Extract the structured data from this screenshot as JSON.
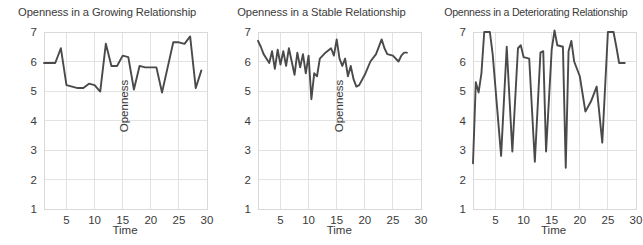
{
  "figure": {
    "width": 643,
    "height": 245,
    "background": "#ffffff",
    "line_color": "#4a4a4a",
    "grid_color": "#e2e2e2",
    "text_color": "#3a3a3a"
  },
  "chart_data": [
    {
      "type": "line",
      "title": "Openness in a Growing Relationship",
      "xlabel": "Time",
      "ylabel": "Openness",
      "xlim": [
        1,
        30
      ],
      "ylim": [
        1,
        7
      ],
      "xticks": [
        5,
        10,
        15,
        20,
        25,
        30
      ],
      "yticks": [
        1,
        2,
        3,
        4,
        5,
        6,
        7
      ],
      "grid": true,
      "legend": "none",
      "x": [
        1,
        2,
        3,
        4,
        5,
        6,
        7,
        8,
        9,
        10,
        11,
        12,
        13,
        14,
        15,
        16,
        17,
        18,
        19,
        20,
        21,
        22,
        23,
        24,
        25,
        26,
        27,
        28,
        29
      ],
      "values": [
        5.95,
        5.95,
        5.95,
        6.45,
        5.2,
        5.15,
        5.1,
        5.1,
        5.25,
        5.2,
        4.98,
        6.6,
        5.85,
        5.85,
        6.2,
        6.15,
        5.05,
        5.85,
        5.8,
        5.8,
        5.8,
        4.95,
        5.8,
        6.65,
        6.65,
        6.6,
        6.85,
        5.1,
        5.7
      ]
    },
    {
      "type": "line",
      "title": "Openness in a Stable Relationship",
      "xlabel": "Time",
      "ylabel": "Openness",
      "xlim": [
        1,
        30
      ],
      "ylim": [
        1,
        7
      ],
      "xticks": [
        5,
        10,
        15,
        20,
        25,
        30
      ],
      "yticks": [
        1,
        2,
        3,
        4,
        5,
        6,
        7
      ],
      "grid": true,
      "legend": "none",
      "x": [
        1,
        1.5,
        2,
        2.5,
        3,
        3.5,
        4,
        4.5,
        5,
        5.5,
        6,
        6.5,
        7,
        7.5,
        8,
        8.5,
        9,
        9.5,
        10,
        10.5,
        11,
        11.5,
        12,
        13,
        14,
        14.5,
        15,
        15.5,
        16,
        16.5,
        17,
        17.5,
        18,
        18.5,
        19,
        20,
        21,
        22,
        23,
        23.5,
        24,
        25,
        26,
        26.5,
        27,
        27.5
      ],
      "values": [
        6.7,
        6.5,
        6.25,
        6.1,
        5.95,
        6.35,
        5.75,
        6.4,
        5.9,
        6.35,
        5.85,
        6.45,
        6.0,
        5.55,
        6.3,
        5.8,
        6.25,
        5.6,
        6.2,
        4.72,
        5.6,
        5.5,
        6.1,
        6.3,
        6.45,
        6.2,
        6.75,
        6.1,
        5.85,
        6.1,
        5.5,
        5.85,
        5.4,
        5.15,
        5.2,
        5.55,
        6.0,
        6.25,
        6.75,
        6.45,
        6.25,
        6.2,
        6.0,
        6.2,
        6.3,
        6.3
      ]
    },
    {
      "type": "line",
      "title": "Openness in a Deteriorating Relationship",
      "xlabel": "Time",
      "ylabel": "Openness",
      "xlim": [
        1,
        30
      ],
      "ylim": [
        1,
        7
      ],
      "xticks": [
        5,
        10,
        15,
        20,
        25,
        30
      ],
      "yticks": [
        1,
        2,
        3,
        4,
        5,
        6,
        7
      ],
      "grid": true,
      "legend": "none",
      "x": [
        1,
        1.5,
        2,
        2.5,
        3,
        4,
        4.5,
        6,
        7,
        8,
        9,
        9.5,
        10,
        11,
        12,
        13,
        13.5,
        14,
        15,
        15.5,
        16,
        17,
        17.5,
        18,
        18.5,
        19,
        20,
        21,
        22,
        23,
        24,
        25,
        26,
        26.5,
        27,
        27.5,
        28
      ],
      "values": [
        2.55,
        5.3,
        4.95,
        5.6,
        7.0,
        7.0,
        6.25,
        2.8,
        6.5,
        2.95,
        6.45,
        6.55,
        6.15,
        6.1,
        2.6,
        6.3,
        6.35,
        2.95,
        6.4,
        7.05,
        6.55,
        6.5,
        2.4,
        6.35,
        6.7,
        6.0,
        5.5,
        4.3,
        4.65,
        5.15,
        3.25,
        7.0,
        7.0,
        6.5,
        5.95,
        5.95,
        5.95
      ]
    }
  ]
}
